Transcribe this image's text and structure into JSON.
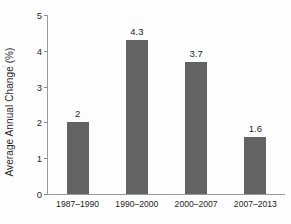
{
  "chart_data": {
    "type": "bar",
    "title": "",
    "xlabel": "",
    "ylabel": "Average Annual Change (%)",
    "categories": [
      "1987–1990",
      "1990–2000",
      "2000–2007",
      "2007–2013"
    ],
    "values": [
      2,
      4.3,
      3.7,
      1.6
    ],
    "value_labels": [
      "2",
      "4.3",
      "3.7",
      "1.6"
    ],
    "ylim": [
      0,
      5
    ],
    "yticks": [
      0,
      1,
      2,
      3,
      4,
      5
    ],
    "ytick_labels": [
      "0",
      "1",
      "2",
      "3",
      "4",
      "5"
    ],
    "grid": false,
    "legend": false,
    "bar_color": "#636363",
    "axis_color": "#9a9a9a",
    "text_color": "#1f1f1f"
  }
}
